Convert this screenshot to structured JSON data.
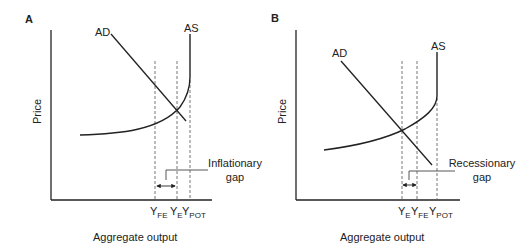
{
  "panels": [
    {
      "id": "A",
      "letter": "A",
      "y_axis_label": "Price",
      "x_axis_label": "Aggregate output",
      "curves": {
        "ad": "AD",
        "as": "AS"
      },
      "gap_label_line1": "Inflationary",
      "gap_label_line2": "gap",
      "ticks": [
        {
          "main": "Y",
          "sub": "FE"
        },
        {
          "main": "Y",
          "sub": "E"
        },
        {
          "main": "Y",
          "sub": "POT"
        }
      ]
    },
    {
      "id": "B",
      "letter": "B",
      "y_axis_label": "Price",
      "x_axis_label": "Aggregate output",
      "curves": {
        "ad": "AD",
        "as": "AS"
      },
      "gap_label_line1": "Recessionary",
      "gap_label_line2": "gap",
      "ticks": [
        {
          "main": "Y",
          "sub": "E"
        },
        {
          "main": "Y",
          "sub": "FE"
        },
        {
          "main": "Y",
          "sub": "POT"
        }
      ]
    }
  ]
}
